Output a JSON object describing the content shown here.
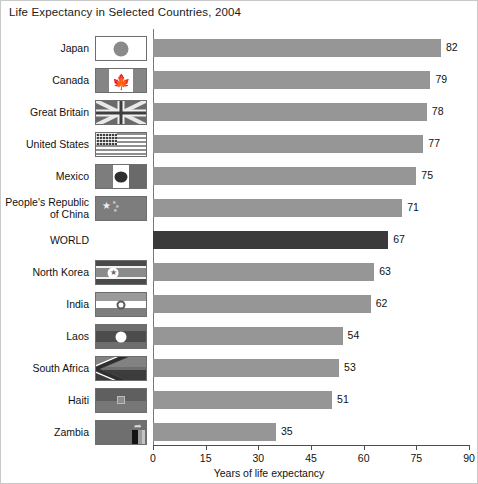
{
  "chart_data": {
    "type": "bar",
    "orientation": "horizontal",
    "title": "Life Expectancy in Selected Countries, 2004",
    "xlabel": "Years of life expectancy",
    "ylabel": "",
    "xlim": [
      0,
      90
    ],
    "xticks": [
      0,
      15,
      30,
      45,
      60,
      75,
      90
    ],
    "grid": false,
    "legend": "none",
    "categories": [
      "Japan",
      "Canada",
      "Great Britain",
      "United States",
      "Mexico",
      "People's Republic\nof China",
      "WORLD",
      "North Korea",
      "India",
      "Laos",
      "South Africa",
      "Haiti",
      "Zambia"
    ],
    "values": [
      82,
      79,
      78,
      77,
      75,
      71,
      67,
      63,
      62,
      54,
      53,
      51,
      35
    ],
    "value_labels": [
      "82",
      "79",
      "78",
      "77",
      "75",
      "71",
      "67",
      "63",
      "62",
      "54",
      "53",
      "51",
      "35"
    ],
    "tick_labels": [
      "0",
      "15",
      "30",
      "45",
      "60",
      "75",
      "90"
    ],
    "highlight_category": "WORLD",
    "colors": {
      "bar": "#969696",
      "bar_highlight": "#3a3a3a",
      "axis": "#4d4d4d",
      "text": "#111111",
      "background": "#ffffff",
      "border": "#c8c8c8"
    },
    "flags": [
      {
        "country": "Japan",
        "icon": "flag-japan-icon"
      },
      {
        "country": "Canada",
        "icon": "flag-canada-icon"
      },
      {
        "country": "Great Britain",
        "icon": "flag-great-britain-icon"
      },
      {
        "country": "United States",
        "icon": "flag-united-states-icon"
      },
      {
        "country": "Mexico",
        "icon": "flag-mexico-icon"
      },
      {
        "country": "People's Republic of China",
        "icon": "flag-china-icon"
      },
      {
        "country": "WORLD",
        "icon": "none"
      },
      {
        "country": "North Korea",
        "icon": "flag-north-korea-icon"
      },
      {
        "country": "India",
        "icon": "flag-india-icon"
      },
      {
        "country": "Laos",
        "icon": "flag-laos-icon"
      },
      {
        "country": "South Africa",
        "icon": "flag-south-africa-icon"
      },
      {
        "country": "Haiti",
        "icon": "flag-haiti-icon"
      },
      {
        "country": "Zambia",
        "icon": "flag-zambia-icon"
      }
    ]
  }
}
